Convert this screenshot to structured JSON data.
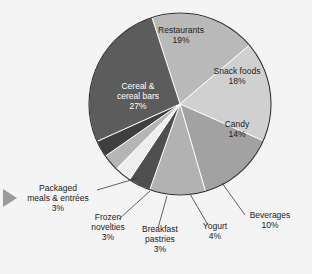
{
  "figure": {
    "marker_icon": "play-triangle-icon",
    "background_color": "#f4f4f4"
  },
  "chart_data": {
    "type": "pie",
    "title": "",
    "subtitle": "",
    "xlabel": "",
    "ylabel": "",
    "legend_position": "none",
    "grid": false,
    "units": "percent",
    "total": 101,
    "start_angle_deg": -18,
    "direction": "clockwise",
    "categories": [
      "Restaurants",
      "Snack foods",
      "Candy",
      "Beverages",
      "Yogurt",
      "Breakfast pastries",
      "Frozen novelties",
      "Packaged meals & entrées",
      "Cereal & cereal bars"
    ],
    "values": [
      19,
      18,
      14,
      10,
      4,
      3,
      3,
      3,
      27
    ],
    "value_labels": [
      "19%",
      "18%",
      "14%",
      "10%",
      "4%",
      "3%",
      "3%",
      "3%",
      "27%"
    ],
    "colors": [
      "#b9b9b9",
      "#d0d0d0",
      "#a2a2a2",
      "#b2b2b2",
      "#4f4f4f",
      "#efefef",
      "#b5b5b5",
      "#3f3f3f",
      "#5c5c5c"
    ],
    "slices": [
      {
        "name": "Restaurants",
        "value": 19,
        "label": "Restaurants",
        "pct": "19%",
        "color": "#b9b9b9",
        "label_placement": "inside",
        "text_color": "#1c1c1c"
      },
      {
        "name": "Snack foods",
        "value": 18,
        "label": "Snack foods",
        "pct": "18%",
        "color": "#d0d0d0",
        "label_placement": "inside",
        "text_color": "#1c1c1c"
      },
      {
        "name": "Candy",
        "value": 14,
        "label": "Candy",
        "pct": "14%",
        "color": "#a2a2a2",
        "label_placement": "inside",
        "text_color": "#1c1c1c"
      },
      {
        "name": "Beverages",
        "value": 10,
        "label": "Beverages",
        "pct": "10%",
        "color": "#b2b2b2",
        "label_placement": "outside",
        "text_color": "#1b1b1b"
      },
      {
        "name": "Yogurt",
        "value": 4,
        "label": "Yogurt",
        "pct": "4%",
        "color": "#4f4f4f",
        "label_placement": "outside",
        "text_color": "#1b1b1b"
      },
      {
        "name": "Breakfast pastries",
        "value": 3,
        "label": "Breakfast pastries",
        "pct": "3%",
        "color": "#efefef",
        "label_placement": "outside",
        "text_color": "#1b1b1b"
      },
      {
        "name": "Frozen novelties",
        "value": 3,
        "label": "Frozen novelties",
        "pct": "3%",
        "color": "#b5b5b5",
        "label_placement": "outside",
        "text_color": "#1b1b1b"
      },
      {
        "name": "Packaged meals & entrées",
        "value": 3,
        "label": "Packaged meals & entrées",
        "pct": "3%",
        "color": "#3f3f3f",
        "label_placement": "outside",
        "text_color": "#1b1b1b"
      },
      {
        "name": "Cereal & cereal bars",
        "value": 27,
        "label": "Cereal & cereal bars",
        "pct": "27%",
        "color": "#5c5c5c",
        "label_placement": "inside",
        "text_color": "#ffffff"
      }
    ]
  },
  "labels": {
    "restaurants": {
      "line1": "Restaurants",
      "pct": "19%"
    },
    "snack_foods": {
      "line1": "Snack foods",
      "pct": "18%"
    },
    "candy": {
      "line1": "Candy",
      "pct": "14%"
    },
    "cereal": {
      "line1": "Cereal &",
      "line2": "cereal bars",
      "pct": "27%"
    },
    "beverages": {
      "line1": "Beverages",
      "pct": "10%"
    },
    "yogurt": {
      "line1": "Yogurt",
      "pct": "4%"
    },
    "breakfast_pastries": {
      "line1": "Breakfast",
      "line2": "pastries",
      "pct": "3%"
    },
    "frozen_novelties": {
      "line1": "Frozen",
      "line2": "novelties",
      "pct": "3%"
    },
    "packaged_meals": {
      "line1": "Packaged",
      "line2": "meals & entrées",
      "pct": "3%"
    }
  }
}
